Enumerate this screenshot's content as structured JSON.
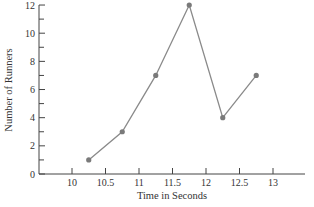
{
  "chart_data": {
    "type": "line",
    "title": "",
    "xlabel": "Time in Seconds",
    "ylabel": "Number of Runners",
    "x": [
      10.25,
      10.75,
      11.25,
      11.75,
      12.25,
      12.75
    ],
    "y": [
      1,
      3,
      7,
      12,
      4,
      7
    ],
    "series": [
      {
        "name": "Runners",
        "x": [
          10.25,
          10.75,
          11.25,
          11.75,
          12.25,
          12.75
        ],
        "values": [
          1,
          3,
          7,
          12,
          4,
          7
        ]
      }
    ],
    "xticks": [
      "10",
      "10.5",
      "11",
      "11.5",
      "12",
      "12.5",
      "13"
    ],
    "yticks": [
      "0",
      "2",
      "4",
      "6",
      "8",
      "10",
      "12"
    ],
    "xlim": [
      9.5,
      13.75
    ],
    "ylim": [
      0,
      12
    ],
    "grid": false,
    "legend": null,
    "colors": {
      "line": "#8a8a8a",
      "marker": "#7a7a7a",
      "axis": "#444444",
      "text": "#333333"
    }
  }
}
